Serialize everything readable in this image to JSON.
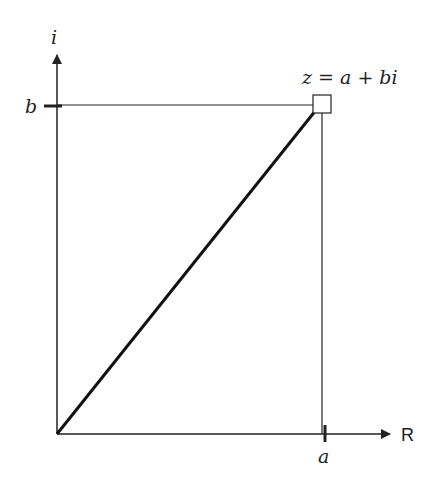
{
  "diagram": {
    "labels": {
      "imag_axis": "i",
      "real_axis": "R",
      "imag_component": "b",
      "real_component": "a",
      "point": "z = a + bi"
    },
    "colors": {
      "line": "#222222",
      "background": "#ffffff"
    },
    "geometry": {
      "origin": [
        57,
        434
      ],
      "point": [
        322,
        104
      ],
      "imag_axis_top": [
        57,
        52
      ],
      "real_axis_end": [
        392,
        434
      ]
    }
  }
}
